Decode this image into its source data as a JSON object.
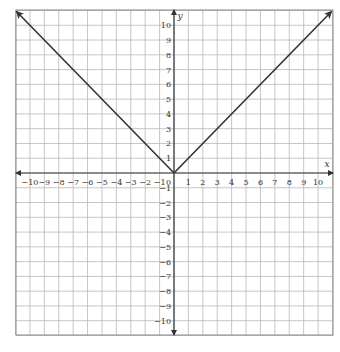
{
  "chart_data": {
    "type": "line",
    "title": "",
    "function": "y = |x|",
    "xlabel": "x",
    "ylabel": "y",
    "xlim": [
      -11,
      11
    ],
    "ylim": [
      -11,
      11
    ],
    "grid": true,
    "x_ticks": [
      -10,
      -9,
      -8,
      -7,
      -6,
      -5,
      -4,
      -3,
      -2,
      -1,
      1,
      2,
      3,
      4,
      5,
      6,
      7,
      8,
      9,
      10
    ],
    "y_ticks": [
      -10,
      -9,
      -8,
      -7,
      -6,
      -5,
      -4,
      -3,
      -2,
      -1,
      1,
      2,
      3,
      4,
      5,
      6,
      7,
      8,
      9,
      10
    ],
    "origin_label": "0",
    "series": [
      {
        "name": "y = |x|",
        "x": [
          -11,
          0,
          11
        ],
        "y": [
          11,
          0,
          11
        ],
        "arrows": "both"
      }
    ],
    "colors": {
      "grid": "#b8b8b8",
      "axis": "#333333",
      "line": "#333333",
      "border": "#888888"
    }
  }
}
